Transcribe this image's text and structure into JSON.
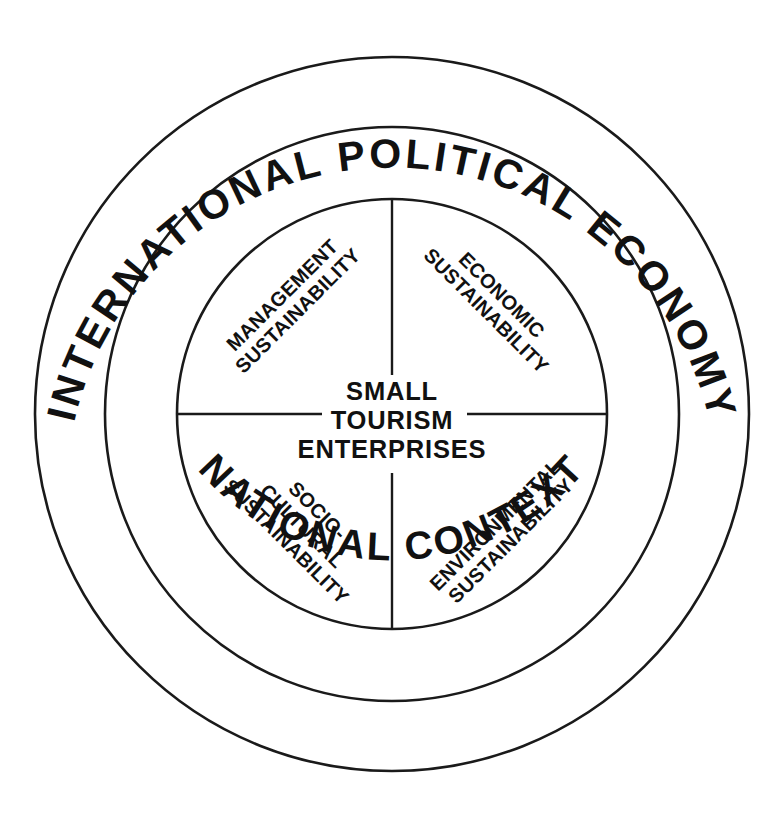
{
  "diagram": {
    "title_semantic": "sustainability-framework-for-small-tourism-enterprises",
    "background_color": "#ffffff",
    "line_color": "#1a1a1a",
    "text_color": "#111111",
    "geometry": {
      "center_x": 392,
      "center_y": 414,
      "outer_radius": 357,
      "middle_radius": 287,
      "inner_radius": 215,
      "stroke_width_outer": 2.6,
      "stroke_width_middle": 2.6,
      "stroke_width_inner": 2.6
    },
    "rings": [
      {
        "id": "outer-ring",
        "label": "INTERNATIONAL POLITICAL ECONOMY",
        "position": "top-arc"
      },
      {
        "id": "middle-ring",
        "label": "NATIONAL CONTEXT",
        "position": "bottom-arc"
      }
    ],
    "center": {
      "lines": [
        "SMALL",
        "TOURISM",
        "ENTERPRISES"
      ]
    },
    "quadrants": [
      {
        "id": "quadrant-management",
        "position": "top-left",
        "lines": [
          "MANAGEMENT",
          "SUSTAINABILITY"
        ],
        "rotation_deg": -45
      },
      {
        "id": "quadrant-economic",
        "position": "top-right",
        "lines": [
          "ECONOMIC",
          "SUSTAINABILITY"
        ],
        "rotation_deg": 45
      },
      {
        "id": "quadrant-socio-cultural",
        "position": "bottom-left",
        "lines": [
          "SOCIO-",
          "CULTURAL",
          "SUSTAINABILITY"
        ],
        "rotation_deg": 45
      },
      {
        "id": "quadrant-environmental",
        "position": "bottom-right",
        "lines": [
          "ENVIRONMENTAL",
          "SUSTAINABILITY"
        ],
        "rotation_deg": -45
      }
    ],
    "dividers": {
      "vertical_top": "from inner circle top to above center text",
      "vertical_bottom": "from below center text to inner circle bottom",
      "horizontal_left": "from inner circle left edge to left of center text",
      "horizontal_right": "from right of center text to inner circle right edge"
    }
  }
}
